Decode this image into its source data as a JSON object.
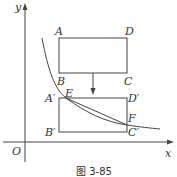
{
  "figure": {
    "caption": "图 3-85",
    "axes": {
      "x_label": "x",
      "y_label": "y",
      "origin_label": "O"
    },
    "rect_top": {
      "A": "A",
      "B": "B",
      "C": "C",
      "D": "D"
    },
    "rect_bottom": {
      "A": "A′",
      "B": "B′",
      "C": "C′",
      "D": "D′"
    },
    "points": {
      "E": "E",
      "F": "F"
    },
    "colors": {
      "stroke": "#444444",
      "text": "#333333",
      "background": "#ffffff"
    }
  }
}
